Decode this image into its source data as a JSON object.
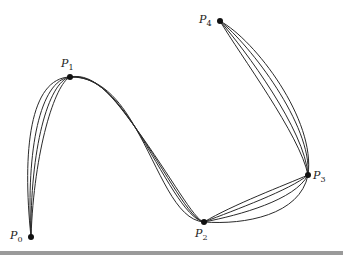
{
  "diagram": {
    "type": "interpolating-curves",
    "points": [
      {
        "name": "P0",
        "base": "P",
        "sub": "0",
        "x": 31,
        "y": 237,
        "label_x": 10,
        "label_y": 230
      },
      {
        "name": "P1",
        "base": "P",
        "sub": "1",
        "x": 70,
        "y": 77,
        "label_x": 61,
        "label_y": 58
      },
      {
        "name": "P2",
        "base": "P",
        "sub": "2",
        "x": 204,
        "y": 222,
        "label_x": 195,
        "label_y": 228
      },
      {
        "name": "P3",
        "base": "P",
        "sub": "3",
        "x": 308,
        "y": 175,
        "label_x": 313,
        "label_y": 170
      },
      {
        "name": "P4",
        "base": "P",
        "sub": "4",
        "x": 220,
        "y": 21,
        "label_x": 199,
        "label_y": 14
      }
    ],
    "curves": [
      {
        "name": "curve-1",
        "d": "M31,237 C22,150 30,78 70,77 C105,76 125,110 135,127 C160,170 175,220 204,222 C245,225 300,215 308,175 C316,120 255,40 220,21"
      },
      {
        "name": "curve-2",
        "d": "M31,237 C26,150 40,80 70,77 C100,75 120,105 135,127 C165,175 185,218 204,222 C240,215 295,200 308,175 C312,125 250,45 220,21"
      },
      {
        "name": "curve-3",
        "d": "M31,237 C30,150 48,82 70,77 C98,74 118,103 135,127 C168,175 190,220 204,222 C235,210 290,190 308,175 C305,130 245,50 220,21"
      },
      {
        "name": "curve-4",
        "d": "M31,237 C34,150 55,84 70,77 C95,72 115,100 135,127 C172,178 194,220 204,222 C232,205 285,185 308,175 C300,135 240,55 220,21"
      }
    ],
    "stroke_color": "#2a2a2a",
    "point_color": "#111111",
    "rule_color": "#9a9a9a"
  }
}
